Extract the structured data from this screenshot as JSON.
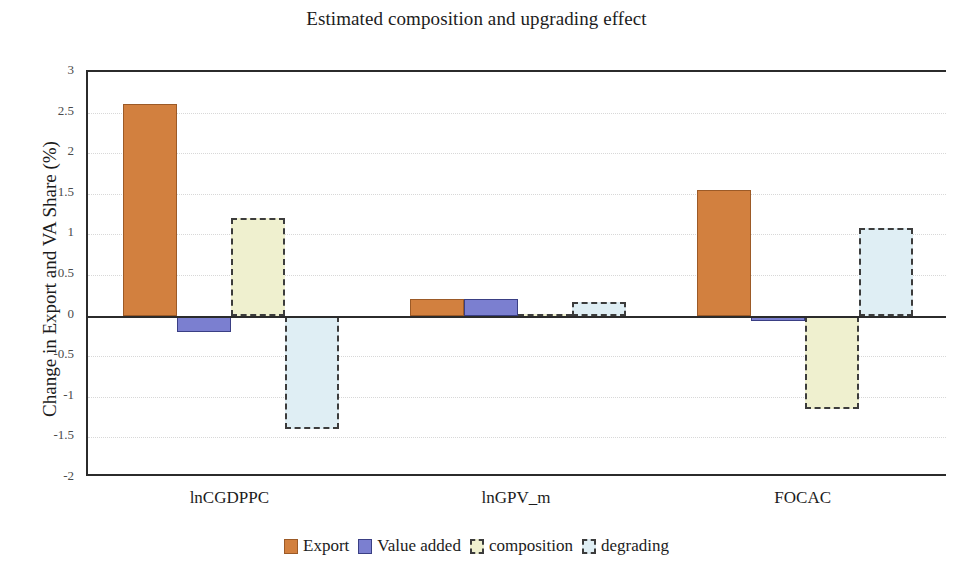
{
  "chart_data": {
    "type": "bar",
    "title": "Estimated composition and upgrading effect",
    "xlabel": "",
    "ylabel": "Change in Export and VA Share (%)",
    "ylim": [
      -2,
      3
    ],
    "ytick_step": 0.5,
    "yticks": [
      "3",
      "2.5",
      "2",
      "1.5",
      "1",
      "0.5",
      "0",
      "-0.5",
      "-1",
      "-1.5",
      "-2"
    ],
    "ytick_values": [
      3,
      2.5,
      2,
      1.5,
      1,
      0.5,
      0,
      -0.5,
      -1,
      -1.5,
      -2
    ],
    "grid": true,
    "legend_position": "bottom",
    "categories": [
      "lnCGDPPC",
      "lnGPV_m",
      "FOCAC"
    ],
    "series": [
      {
        "name": "Export",
        "color": "#d2803f",
        "style": "solid",
        "values": [
          2.6,
          0.2,
          1.55
        ]
      },
      {
        "name": "Value added",
        "color": "#7b7fd0",
        "style": "solid",
        "values": [
          -0.2,
          0.2,
          -0.07
        ]
      },
      {
        "name": "composition",
        "color": "#eff0cf",
        "style": "dashed",
        "values": [
          1.2,
          0.02,
          -1.15
        ]
      },
      {
        "name": "degrading",
        "color": "#dfeef4",
        "style": "dashed",
        "values": [
          -1.4,
          0.17,
          1.08
        ]
      }
    ]
  }
}
